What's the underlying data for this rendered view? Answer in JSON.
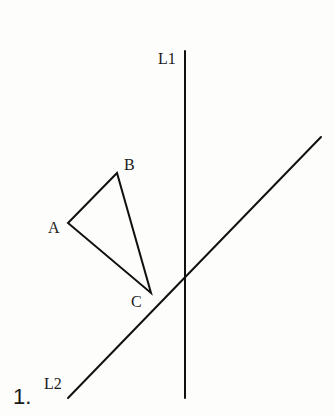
{
  "figure": {
    "problem_number": "1.",
    "colors": {
      "stroke": "#111111",
      "text": "#1a1a1a",
      "background": "#fdfdfc"
    },
    "lines": {
      "L1": {
        "label": "L1",
        "orientation": "vertical",
        "x1": 185,
        "y1": 51,
        "x2": 185,
        "y2": 398,
        "label_x": 158,
        "label_y": 64
      },
      "L2": {
        "label": "L2",
        "orientation": "diagonal",
        "x1": 68,
        "y1": 398,
        "x2": 321,
        "y2": 137,
        "label_x": 44,
        "label_y": 389
      }
    },
    "triangle": {
      "vertices": [
        {
          "name": "A",
          "x": 68,
          "y": 223,
          "label_x": 48,
          "label_y": 233
        },
        {
          "name": "B",
          "x": 117,
          "y": 173,
          "label_x": 124,
          "label_y": 170
        },
        {
          "name": "C",
          "x": 151,
          "y": 293,
          "label_x": 131,
          "label_y": 307
        }
      ]
    }
  }
}
